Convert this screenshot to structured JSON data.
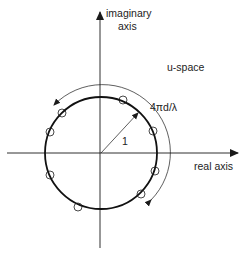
{
  "diagram": {
    "title": "u-space",
    "labels": {
      "imaginary_line1": "imaginary",
      "imaginary_line2": "axis",
      "real": "real axis",
      "space": "u-space",
      "arc": "4πd/λ",
      "radius": "1"
    },
    "colors": {
      "stroke": "#1a1a1a",
      "text": "#222222",
      "background": "#ffffff"
    },
    "geometry": {
      "center": [
        101,
        153
      ],
      "unit_circle_radius": 56,
      "outer_arc_radius": 67
    },
    "elements": [
      {
        "x": 123,
        "y": 100
      },
      {
        "x": 62,
        "y": 113
      },
      {
        "x": 50,
        "y": 132
      },
      {
        "x": 50,
        "y": 175
      },
      {
        "x": 78,
        "y": 207
      },
      {
        "x": 153,
        "y": 131
      },
      {
        "x": 155,
        "y": 171
      },
      {
        "x": 141,
        "y": 194
      }
    ]
  }
}
